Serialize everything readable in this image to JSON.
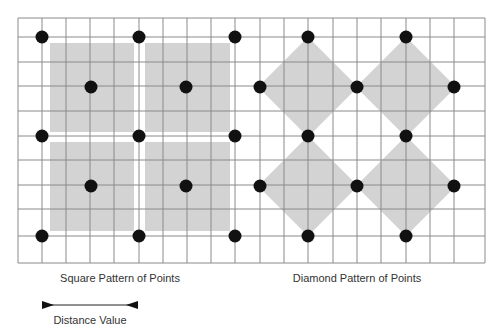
{
  "colors": {
    "grid": "#8a8a8a",
    "fill": "#d3d3d3",
    "dot": "#111111",
    "text": "#333333"
  },
  "grid": {
    "x0": 18,
    "y0": 18,
    "x1": 485,
    "y1": 263,
    "vlines": [
      18,
      42,
      66,
      90,
      114,
      139,
      163,
      187,
      211,
      235,
      260,
      284,
      308,
      333,
      357,
      381,
      406,
      430,
      454,
      485
    ],
    "hlines": [
      18,
      37,
      62,
      86,
      111,
      136,
      160,
      185,
      209,
      236,
      263
    ]
  },
  "square_pattern": {
    "label": "Square Pattern of Points",
    "squares": [
      [
        50,
        43,
        84,
        89
      ],
      [
        145,
        43,
        85,
        89
      ],
      [
        50,
        142,
        84,
        89
      ],
      [
        145,
        142,
        85,
        89
      ]
    ],
    "dots": [
      [
        42,
        37
      ],
      [
        139,
        37
      ],
      [
        235,
        37
      ],
      [
        91,
        87
      ],
      [
        186,
        87
      ],
      [
        42,
        136
      ],
      [
        139,
        136
      ],
      [
        235,
        136
      ],
      [
        91,
        186
      ],
      [
        186,
        186
      ],
      [
        42,
        236
      ],
      [
        139,
        236
      ],
      [
        235,
        236
      ]
    ]
  },
  "diamond_pattern": {
    "label": "Diamond Pattern of Points",
    "diamonds": [
      [
        308,
        87,
        50
      ],
      [
        406,
        87,
        50
      ],
      [
        308,
        186,
        50
      ],
      [
        406,
        186,
        50
      ]
    ],
    "dots": [
      [
        308,
        37
      ],
      [
        406,
        37
      ],
      [
        260,
        87
      ],
      [
        357,
        87
      ],
      [
        454,
        87
      ],
      [
        308,
        136
      ],
      [
        406,
        136
      ],
      [
        260,
        186
      ],
      [
        357,
        186
      ],
      [
        454,
        186
      ],
      [
        308,
        236
      ],
      [
        406,
        236
      ]
    ]
  },
  "legend": {
    "label": "Distance Value",
    "arrow": {
      "x1": 42,
      "x2": 138,
      "y": 305
    }
  }
}
